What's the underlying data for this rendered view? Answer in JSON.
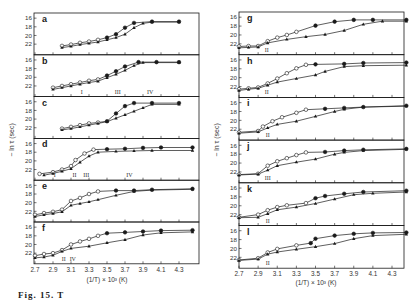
{
  "figure": {
    "caption": "Fig. 15. T",
    "ylabel": "− ln τ (sec)",
    "xlabel": "(1/T) × 10³ (K)",
    "ink": "#1a1a1a"
  },
  "chart_data": {
    "type": "scatter",
    "title": "",
    "xlabel": "(1/T) x 10^3 (K)",
    "ylabel": "-ln tau (sec)",
    "xlim": [
      2.7,
      4.45
    ],
    "ylim_display_top_to_bottom": [
      15.5,
      24.0
    ],
    "x_ticks": [
      "2.7",
      "2.9",
      "3.1",
      "3.3",
      "3.5",
      "3.7",
      "3.9",
      "4.1",
      "4.3"
    ],
    "y_ticks": [
      "16",
      "18",
      "20",
      "22"
    ],
    "series_legend": [
      {
        "name": "open circles / filled circles (upper curve)",
        "marker": "circle"
      },
      {
        "name": "filled triangles (lower curve)",
        "marker": "triangle"
      }
    ],
    "panels": [
      {
        "label": "a",
        "column": "left",
        "roman": [],
        "upper": [
          [
            3.0,
            22.4
          ],
          [
            3.1,
            22.1
          ],
          [
            3.2,
            21.7
          ],
          [
            3.3,
            21.4
          ],
          [
            3.4,
            21.0
          ],
          [
            3.5,
            20.5
          ],
          [
            3.6,
            19.7
          ],
          [
            3.7,
            18.2
          ],
          [
            3.8,
            17.1
          ],
          [
            4.0,
            16.8
          ],
          [
            4.3,
            16.8
          ]
        ],
        "lower": [
          [
            3.0,
            22.8
          ],
          [
            3.1,
            22.5
          ],
          [
            3.2,
            22.1
          ],
          [
            3.3,
            21.8
          ],
          [
            3.4,
            21.5
          ],
          [
            3.5,
            21.0
          ],
          [
            3.6,
            20.5
          ],
          [
            3.7,
            19.7
          ],
          [
            3.8,
            18.2
          ],
          [
            3.9,
            17.2
          ],
          [
            4.0,
            16.9
          ],
          [
            4.3,
            16.9
          ]
        ]
      },
      {
        "label": "b",
        "column": "left",
        "roman": [
          {
            "t": "I",
            "x": 3.22
          },
          {
            "t": "III",
            "x": 3.62
          },
          {
            "t": "IV",
            "x": 3.98
          }
        ],
        "upper": [
          [
            2.9,
            22.4
          ],
          [
            3.0,
            22.0
          ],
          [
            3.1,
            21.6
          ],
          [
            3.2,
            21.2
          ],
          [
            3.3,
            20.8
          ],
          [
            3.4,
            20.5
          ],
          [
            3.5,
            19.6
          ],
          [
            3.6,
            18.6
          ],
          [
            3.7,
            17.5
          ],
          [
            3.85,
            16.5
          ],
          [
            4.05,
            16.5
          ],
          [
            4.3,
            16.5
          ]
        ],
        "lower": [
          [
            2.9,
            22.8
          ],
          [
            3.0,
            22.4
          ],
          [
            3.1,
            22.0
          ],
          [
            3.2,
            21.6
          ],
          [
            3.3,
            21.2
          ],
          [
            3.4,
            20.9
          ],
          [
            3.5,
            20.1
          ],
          [
            3.6,
            19.3
          ],
          [
            3.7,
            18.4
          ],
          [
            3.8,
            17.3
          ],
          [
            3.9,
            16.6
          ],
          [
            4.3,
            16.6
          ]
        ]
      },
      {
        "label": "c",
        "column": "left",
        "roman": [],
        "upper": [
          [
            3.0,
            22.2
          ],
          [
            3.1,
            21.8
          ],
          [
            3.2,
            21.4
          ],
          [
            3.3,
            21.0
          ],
          [
            3.4,
            20.8
          ],
          [
            3.5,
            20.5
          ],
          [
            3.6,
            18.7
          ],
          [
            3.7,
            17.0
          ],
          [
            3.8,
            16.3
          ],
          [
            4.0,
            16.3
          ],
          [
            4.3,
            16.3
          ]
        ],
        "lower": [
          [
            3.0,
            22.5
          ],
          [
            3.1,
            22.2
          ],
          [
            3.2,
            21.8
          ],
          [
            3.3,
            21.4
          ],
          [
            3.4,
            21.0
          ],
          [
            3.5,
            20.6
          ],
          [
            3.6,
            19.8
          ],
          [
            3.7,
            19.0
          ],
          [
            3.8,
            18.2
          ],
          [
            3.9,
            17.4
          ],
          [
            4.0,
            16.6
          ],
          [
            4.3,
            16.6
          ]
        ]
      },
      {
        "label": "d",
        "column": "left",
        "roman": [
          {
            "t": "I",
            "x": 2.92
          },
          {
            "t": "II",
            "x": 3.14
          },
          {
            "t": "III",
            "x": 3.27
          },
          {
            "t": "IV",
            "x": 3.75
          }
        ],
        "upper": [
          [
            2.75,
            23.0
          ],
          [
            2.9,
            22.6
          ],
          [
            3.0,
            22.0
          ],
          [
            3.1,
            21.2
          ],
          [
            3.15,
            19.8
          ],
          [
            3.25,
            18.3
          ],
          [
            3.35,
            17.4
          ],
          [
            3.5,
            17.3
          ],
          [
            3.7,
            17.2
          ],
          [
            3.9,
            17.0
          ],
          [
            4.1,
            16.9
          ],
          [
            4.45,
            16.9
          ]
        ],
        "lower": [
          [
            2.8,
            23.3
          ],
          [
            2.9,
            22.9
          ],
          [
            3.0,
            22.4
          ],
          [
            3.1,
            21.8
          ],
          [
            3.2,
            20.3
          ],
          [
            3.3,
            18.9
          ],
          [
            3.4,
            18.0
          ],
          [
            3.6,
            17.8
          ],
          [
            3.8,
            17.7
          ],
          [
            4.0,
            17.6
          ],
          [
            4.45,
            17.6
          ]
        ]
      },
      {
        "label": "e",
        "column": "left",
        "roman": [],
        "upper": [
          [
            2.7,
            22.8
          ],
          [
            2.8,
            22.4
          ],
          [
            2.9,
            22.1
          ],
          [
            3.0,
            21.6
          ],
          [
            3.1,
            19.6
          ],
          [
            3.2,
            18.9
          ],
          [
            3.3,
            18.0
          ],
          [
            3.4,
            17.4
          ],
          [
            3.6,
            17.2
          ],
          [
            3.8,
            17.2
          ],
          [
            4.0,
            17.0
          ],
          [
            4.45,
            16.8
          ]
        ],
        "lower": [
          [
            2.7,
            23.2
          ],
          [
            2.8,
            22.8
          ],
          [
            2.9,
            22.5
          ],
          [
            3.0,
            22.1
          ],
          [
            3.1,
            20.6
          ],
          [
            3.2,
            20.2
          ],
          [
            3.3,
            19.8
          ],
          [
            3.4,
            19.3
          ],
          [
            3.6,
            18.3
          ],
          [
            3.8,
            17.4
          ],
          [
            4.0,
            17.1
          ],
          [
            4.45,
            16.9
          ]
        ]
      },
      {
        "label": "f",
        "column": "left",
        "roman": [
          {
            "t": "II",
            "x": 3.02
          },
          {
            "t": "IV",
            "x": 3.12
          }
        ],
        "upper": [
          [
            2.7,
            22.6
          ],
          [
            2.8,
            22.2
          ],
          [
            2.9,
            22.0
          ],
          [
            3.0,
            21.3
          ],
          [
            3.1,
            20.0
          ],
          [
            3.2,
            19.3
          ],
          [
            3.3,
            18.7
          ],
          [
            3.4,
            18.0
          ],
          [
            3.5,
            17.4
          ],
          [
            3.7,
            17.2
          ],
          [
            3.9,
            17.0
          ],
          [
            4.1,
            16.8
          ],
          [
            4.45,
            16.7
          ]
        ],
        "lower": [
          [
            2.7,
            23.1
          ],
          [
            2.8,
            22.9
          ],
          [
            2.9,
            22.5
          ],
          [
            3.0,
            21.6
          ],
          [
            3.1,
            20.9
          ],
          [
            3.3,
            20.4
          ],
          [
            3.5,
            19.6
          ],
          [
            3.7,
            18.9
          ],
          [
            3.9,
            17.8
          ],
          [
            4.1,
            17.3
          ],
          [
            4.45,
            17.1
          ]
        ]
      },
      {
        "label": "g",
        "column": "right",
        "roman": [
          {
            "t": "II",
            "x": 2.99
          }
        ],
        "upper": [
          [
            2.7,
            22.6
          ],
          [
            2.8,
            22.5
          ],
          [
            2.9,
            22.5
          ],
          [
            3.0,
            21.4
          ],
          [
            3.1,
            20.6
          ],
          [
            3.2,
            20.0
          ],
          [
            3.3,
            19.3
          ],
          [
            3.5,
            17.9
          ],
          [
            3.7,
            17.0
          ],
          [
            3.9,
            16.6
          ],
          [
            4.1,
            16.6
          ],
          [
            4.45,
            16.6
          ]
        ],
        "lower": [
          [
            2.7,
            22.9
          ],
          [
            2.8,
            22.8
          ],
          [
            2.9,
            22.7
          ],
          [
            3.0,
            21.8
          ],
          [
            3.2,
            21.0
          ],
          [
            3.4,
            20.4
          ],
          [
            3.6,
            19.9
          ],
          [
            3.8,
            19.0
          ],
          [
            4.0,
            17.6
          ],
          [
            4.2,
            16.9
          ],
          [
            4.45,
            16.9
          ]
        ]
      },
      {
        "label": "h",
        "column": "right",
        "roman": [
          {
            "t": "II",
            "x": 2.99
          }
        ],
        "upper": [
          [
            2.7,
            22.6
          ],
          [
            2.8,
            22.4
          ],
          [
            2.9,
            22.2
          ],
          [
            3.0,
            21.3
          ],
          [
            3.1,
            20.2
          ],
          [
            3.2,
            19.0
          ],
          [
            3.3,
            17.9
          ],
          [
            3.4,
            17.1
          ],
          [
            3.5,
            17.0
          ],
          [
            3.8,
            16.9
          ],
          [
            4.0,
            16.7
          ],
          [
            4.45,
            16.6
          ]
        ],
        "lower": [
          [
            2.7,
            22.9
          ],
          [
            2.8,
            22.6
          ],
          [
            2.9,
            22.4
          ],
          [
            3.0,
            21.7
          ],
          [
            3.1,
            21.0
          ],
          [
            3.3,
            20.2
          ],
          [
            3.5,
            19.4
          ],
          [
            3.6,
            18.6
          ],
          [
            3.8,
            17.5
          ],
          [
            4.0,
            17.3
          ],
          [
            4.45,
            17.2
          ]
        ]
      },
      {
        "label": "i",
        "column": "right",
        "roman": [
          {
            "t": "II",
            "x": 3.0
          }
        ],
        "upper": [
          [
            2.7,
            22.7
          ],
          [
            2.9,
            22.4
          ],
          [
            2.95,
            21.4
          ],
          [
            3.05,
            20.2
          ],
          [
            3.15,
            19.3
          ],
          [
            3.3,
            18.3
          ],
          [
            3.4,
            17.6
          ],
          [
            3.6,
            17.4
          ],
          [
            3.8,
            17.2
          ],
          [
            4.0,
            17.0
          ],
          [
            4.45,
            16.7
          ]
        ],
        "lower": [
          [
            2.7,
            22.9
          ],
          [
            2.9,
            22.6
          ],
          [
            3.0,
            21.7
          ],
          [
            3.1,
            20.9
          ],
          [
            3.3,
            20.2
          ],
          [
            3.5,
            19.1
          ],
          [
            3.7,
            18.0
          ],
          [
            3.8,
            17.5
          ],
          [
            4.0,
            17.0
          ],
          [
            4.45,
            16.8
          ]
        ]
      },
      {
        "label": "j",
        "column": "right",
        "roman": [
          {
            "t": "III",
            "x": 3.0
          }
        ],
        "upper": [
          [
            2.7,
            22.6
          ],
          [
            2.9,
            22.4
          ],
          [
            3.0,
            20.6
          ],
          [
            3.1,
            19.6
          ],
          [
            3.2,
            18.9
          ],
          [
            3.3,
            18.2
          ],
          [
            3.4,
            17.6
          ],
          [
            3.6,
            17.5
          ],
          [
            3.8,
            17.2
          ],
          [
            4.0,
            17.0
          ],
          [
            4.45,
            16.8
          ]
        ],
        "lower": [
          [
            2.7,
            22.7
          ],
          [
            2.9,
            22.5
          ],
          [
            3.0,
            21.6
          ],
          [
            3.1,
            20.6
          ],
          [
            3.3,
            19.8
          ],
          [
            3.5,
            19.1
          ],
          [
            3.7,
            18.0
          ],
          [
            3.8,
            17.6
          ],
          [
            4.0,
            17.2
          ],
          [
            4.45,
            16.9
          ]
        ]
      },
      {
        "label": "k",
        "column": "right",
        "roman": [
          {
            "t": "II",
            "x": 3.0
          }
        ],
        "upper": [
          [
            2.7,
            22.6
          ],
          [
            2.9,
            22.0
          ],
          [
            3.0,
            21.0
          ],
          [
            3.1,
            20.3
          ],
          [
            3.2,
            19.9
          ],
          [
            3.4,
            19.4
          ],
          [
            3.5,
            18.3
          ],
          [
            3.6,
            17.8
          ],
          [
            3.8,
            17.3
          ],
          [
            4.0,
            16.9
          ],
          [
            4.45,
            16.6
          ]
        ],
        "lower": [
          [
            2.7,
            22.7
          ],
          [
            2.9,
            22.6
          ],
          [
            3.0,
            21.8
          ],
          [
            3.1,
            20.9
          ],
          [
            3.3,
            20.3
          ],
          [
            3.5,
            19.5
          ],
          [
            3.7,
            18.5
          ],
          [
            3.9,
            17.5
          ],
          [
            4.1,
            17.2
          ],
          [
            4.45,
            16.9
          ]
        ]
      },
      {
        "label": "l",
        "column": "right",
        "roman": [
          {
            "t": "II",
            "x": 3.0
          }
        ],
        "upper": [
          [
            2.7,
            22.6
          ],
          [
            2.9,
            22.2
          ],
          [
            3.0,
            20.9
          ],
          [
            3.1,
            20.1
          ],
          [
            3.3,
            19.3
          ],
          [
            3.45,
            18.8
          ],
          [
            3.5,
            17.8
          ],
          [
            3.7,
            17.1
          ],
          [
            3.9,
            16.7
          ],
          [
            4.1,
            16.5
          ],
          [
            4.45,
            16.4
          ]
        ],
        "lower": [
          [
            2.7,
            22.7
          ],
          [
            2.9,
            22.4
          ],
          [
            3.0,
            21.3
          ],
          [
            3.1,
            20.8
          ],
          [
            3.3,
            20.2
          ],
          [
            3.5,
            19.6
          ],
          [
            3.7,
            18.9
          ],
          [
            3.9,
            17.8
          ],
          [
            4.1,
            17.1
          ],
          [
            4.45,
            16.8
          ]
        ]
      }
    ]
  }
}
